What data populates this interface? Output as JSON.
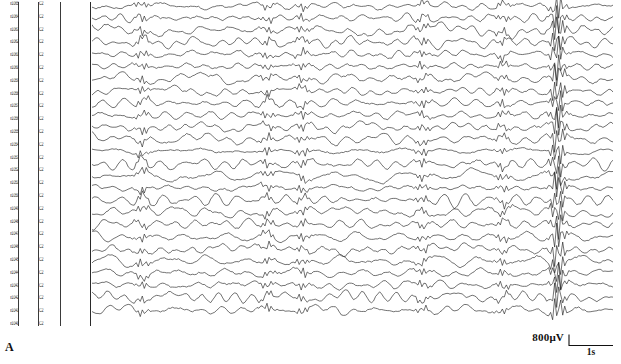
{
  "figure": {
    "panel_letter": "A",
    "type": "eeg-multichannel-recording"
  },
  "scale_bar": {
    "amplitude_label": "800μV",
    "time_label": "1s",
    "amplitude_value": 800,
    "amplitude_unit": "μV",
    "time_value": 1,
    "time_unit": "s"
  },
  "channels": {
    "count": 26,
    "montage": "bipolar",
    "header_left": "x1065",
    "header_right": "C2",
    "left_labels": [
      "x1065",
      "x1064",
      "x1063",
      "x1062",
      "x1061",
      "x1060",
      "x1059",
      "x1058",
      "x1057",
      "x1056",
      "x1055",
      "x1054",
      "x1053",
      "x1052",
      "x1051",
      "x1050",
      "x1049",
      "x1048",
      "x1047",
      "x1046",
      "x1045",
      "x1044",
      "x1043",
      "x1042",
      "x1041",
      "x1040"
    ],
    "right_labels": [
      "C2",
      "C2",
      "C2",
      "C2",
      "C2",
      "C2",
      "C2",
      "C2",
      "C2",
      "C2",
      "C2",
      "C2",
      "C2",
      "C2",
      "C2",
      "C2",
      "C2",
      "C2",
      "C2",
      "C2",
      "C2",
      "C2",
      "C2",
      "C2",
      "C2",
      "C2"
    ]
  },
  "chart_data": {
    "type": "line",
    "title": "",
    "subtitle": "",
    "xlabel": "Time",
    "ylabel": "Channel",
    "grid": false,
    "legend": "none",
    "x_unit": "s",
    "y_unit": "μV",
    "x_range_seconds": [
      0,
      10.4
    ],
    "amplitude_scale_uv": 800,
    "n_series": 26,
    "samples_per_series": 260,
    "burst_times_seconds": [
      1.0,
      3.5,
      4.2,
      6.6,
      8.2,
      9.3
    ],
    "series": [
      {
        "name": "ch-01",
        "baseline": 6
      },
      {
        "name": "ch-02",
        "baseline": 18
      },
      {
        "name": "ch-03",
        "baseline": 30
      },
      {
        "name": "ch-04",
        "baseline": 42
      },
      {
        "name": "ch-05",
        "baseline": 54
      },
      {
        "name": "ch-06",
        "baseline": 66
      },
      {
        "name": "ch-07",
        "baseline": 78
      },
      {
        "name": "ch-08",
        "baseline": 91
      },
      {
        "name": "ch-09",
        "baseline": 103
      },
      {
        "name": "ch-10",
        "baseline": 115
      },
      {
        "name": "ch-11",
        "baseline": 127
      },
      {
        "name": "ch-12",
        "baseline": 139
      },
      {
        "name": "ch-13",
        "baseline": 151
      },
      {
        "name": "ch-14",
        "baseline": 164
      },
      {
        "name": "ch-15",
        "baseline": 176
      },
      {
        "name": "ch-16",
        "baseline": 188
      },
      {
        "name": "ch-17",
        "baseline": 200
      },
      {
        "name": "ch-18",
        "baseline": 212
      },
      {
        "name": "ch-19",
        "baseline": 224
      },
      {
        "name": "ch-20",
        "baseline": 237
      },
      {
        "name": "ch-21",
        "baseline": 249
      },
      {
        "name": "ch-22",
        "baseline": 261
      },
      {
        "name": "ch-23",
        "baseline": 273
      },
      {
        "name": "ch-24",
        "baseline": 285
      },
      {
        "name": "ch-25",
        "baseline": 297
      },
      {
        "name": "ch-26",
        "baseline": 310
      }
    ]
  }
}
